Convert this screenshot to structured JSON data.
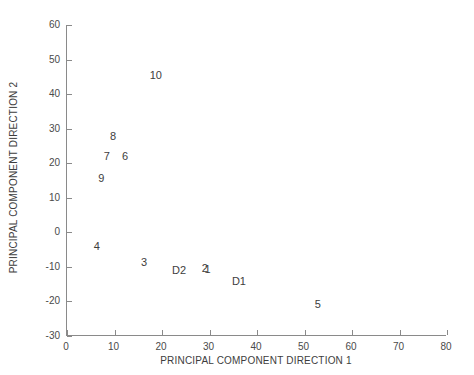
{
  "chart_data": {
    "type": "scatter",
    "title": "",
    "subtitle": "",
    "xlabel": "PRINCIPAL COMPONENT DIRECTION 1",
    "ylabel": "PRINCIPAL COMPONENT DIRECTION 2",
    "xlim": [
      0,
      80
    ],
    "ylim": [
      -30,
      60
    ],
    "xticks": [
      0,
      10,
      20,
      30,
      40,
      50,
      60,
      70,
      80
    ],
    "yticks": [
      -30,
      -20,
      -10,
      0,
      10,
      20,
      30,
      40,
      50,
      60
    ],
    "xticklabels": [
      "0",
      "10",
      "20",
      "30",
      "40",
      "50",
      "60",
      "70",
      "80"
    ],
    "yticklabels": [
      "-30",
      "-20",
      "-10",
      "0",
      "10",
      "20",
      "30",
      "40",
      "50",
      "60"
    ],
    "grid": false,
    "legend": null,
    "marker_style": "text-label",
    "point_color": "#3d3d3d",
    "axis_color": "#8a8a8a",
    "background_color": "#ffffff",
    "points": [
      {
        "label": "10",
        "x": 18.7,
        "y": 45.5
      },
      {
        "label": "8",
        "x": 9.7,
        "y": 28.0
      },
      {
        "label": "7",
        "x": 8.4,
        "y": 22.0
      },
      {
        "label": "6",
        "x": 12.2,
        "y": 22.0
      },
      {
        "label": "9",
        "x": 7.2,
        "y": 15.7
      },
      {
        "label": "4",
        "x": 6.3,
        "y": -4.0
      },
      {
        "label": "3",
        "x": 16.2,
        "y": -8.7
      },
      {
        "label": "D2",
        "x": 23.6,
        "y": -11.0
      },
      {
        "label": "2",
        "x": 29.0,
        "y": -10.4
      },
      {
        "label": "1",
        "x": 29.6,
        "y": -10.7
      },
      {
        "label": "D1",
        "x": 36.2,
        "y": -14.2
      },
      {
        "label": "5",
        "x": 52.8,
        "y": -20.6
      }
    ]
  }
}
